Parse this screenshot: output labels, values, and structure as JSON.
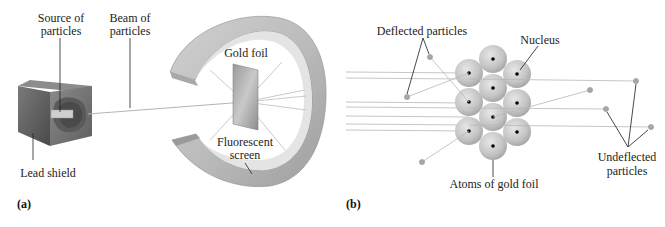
{
  "panel_a": {
    "tag": "(a)",
    "labels": {
      "source_line1": "Source of",
      "source_line2": "particles",
      "beam_line1": "Beam of",
      "beam_line2": "particles",
      "gold_foil": "Gold foil",
      "screen_line1": "Fluorescent",
      "screen_line2": "screen",
      "lead_shield": "Lead shield"
    }
  },
  "panel_b": {
    "tag": "(b)",
    "labels": {
      "deflected": "Deflected particles",
      "nucleus": "Nucleus",
      "atoms": "Atoms of gold foil",
      "undeflected_line1": "Undeflected",
      "undeflected_line2": "particles"
    }
  },
  "colors": {
    "atom_fill": "#c8c8c8",
    "nucleus": "#000000",
    "beam": "#b0b0b0",
    "particle": "#a8a8a8",
    "leader": "#333333",
    "ring_outer": "#bdbdbd",
    "ring_inner": "#d9d9d9",
    "lead_box": "#6d6d6d"
  }
}
